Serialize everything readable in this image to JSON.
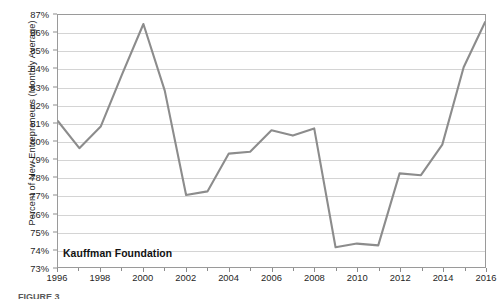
{
  "chart_data": {
    "type": "line",
    "title": "",
    "xlabel": "",
    "ylabel": "Percent of New Entrepreneurs (Monthly Average)",
    "x": [
      1996,
      1997,
      1998,
      1999,
      2000,
      2001,
      2002,
      2003,
      2004,
      2005,
      2006,
      2007,
      2008,
      2009,
      2010,
      2011,
      2012,
      2013,
      2014,
      2015,
      2016
    ],
    "values": [
      81.1,
      79.6,
      80.8,
      83.7,
      86.5,
      82.8,
      77.0,
      77.2,
      79.3,
      79.4,
      80.6,
      80.3,
      80.7,
      74.1,
      74.3,
      74.2,
      78.2,
      78.1,
      79.8,
      84.1,
      86.6
    ],
    "series": [
      {
        "name": "Percent of New Entrepreneurs (Monthly Average)",
        "color": "#8c8c8c",
        "values": [
          81.1,
          79.6,
          80.8,
          83.7,
          86.5,
          82.8,
          77.0,
          77.2,
          79.3,
          79.4,
          80.6,
          80.3,
          80.7,
          74.1,
          74.3,
          74.2,
          78.2,
          78.1,
          79.8,
          84.1,
          86.6
        ]
      }
    ],
    "xlim": [
      1996,
      2016
    ],
    "ylim": [
      73,
      87
    ],
    "ytick_values": [
      73,
      74,
      75,
      76,
      77,
      78,
      79,
      80,
      81,
      82,
      83,
      84,
      85,
      86,
      87
    ],
    "ytick_labels": [
      "73%",
      "74%",
      "75%",
      "76%",
      "77%",
      "78%",
      "79%",
      "80%",
      "81%",
      "82%",
      "83%",
      "84%",
      "85%",
      "86%",
      "87%"
    ],
    "xtick_values": [
      1996,
      1998,
      2000,
      2002,
      2004,
      2006,
      2008,
      2010,
      2012,
      2014,
      2016
    ],
    "xtick_labels": [
      "1996",
      "1998",
      "2000",
      "2002",
      "2004",
      "2006",
      "2008",
      "2010",
      "2012",
      "2014",
      "2016"
    ],
    "xtick_minor_values": [
      1997,
      1999,
      2001,
      2003,
      2005,
      2007,
      2009,
      2011,
      2013,
      2015
    ],
    "grid": true,
    "grid_axis": "y",
    "legend": false
  },
  "annotations": {
    "watermark": "Kauffman Foundation"
  },
  "caption": {
    "cutoff_text": "FIGURE 3"
  },
  "colors": {
    "line": "#8c8c8c",
    "gridline": "#d4d4d4",
    "frame": "#9a9a9a",
    "text": "#1f1f1f",
    "background": "#ffffff"
  }
}
